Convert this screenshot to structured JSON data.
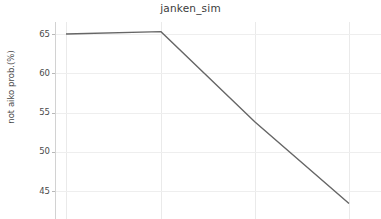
{
  "chart_data": {
    "type": "line",
    "title": "janken_sim",
    "xlabel": "",
    "ylabel": "not aiko prob.(%)",
    "grid": true,
    "legend": null,
    "ylim": [
      42.0,
      66.2
    ],
    "yticks": [
      65,
      60,
      55,
      50,
      45
    ],
    "ytick_labels": [
      "65",
      "60",
      "55",
      "50",
      "45"
    ],
    "xticks": [
      2,
      3,
      4,
      5
    ],
    "xtick_labels": [],
    "note": "x tick labels are cropped off the bottom edge of the figure",
    "series": [
      {
        "name": "not aiko prob.",
        "color": "#666666",
        "linewidth": 1.4,
        "x": [
          2,
          3,
          4,
          5
        ],
        "values": [
          65.0,
          65.3,
          53.8,
          43.4
        ]
      }
    ]
  },
  "figure": {
    "background": "#ffffff",
    "grid_color": "#eaeaea",
    "axis_color": "#d2d2d2",
    "text_color": "#4a4a4a",
    "title_color": "#3b3b3b"
  }
}
